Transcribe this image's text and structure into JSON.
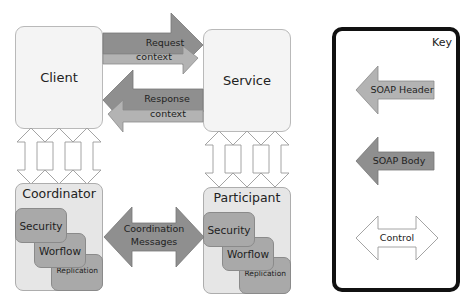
{
  "diagram": {
    "nodes": {
      "client": {
        "label": "Client"
      },
      "service": {
        "label": "Service"
      },
      "coordinator": {
        "label": "Coordinator",
        "modules": [
          {
            "label": "Security"
          },
          {
            "label": "Worflow"
          },
          {
            "label": "Replication"
          }
        ]
      },
      "participant": {
        "label": "Participant",
        "modules": [
          {
            "label": "Security"
          },
          {
            "label": "Worflow"
          },
          {
            "label": "Replication"
          }
        ]
      }
    },
    "edges": {
      "request": {
        "line1": "Request",
        "line2": "context",
        "from": "Client",
        "to": "Service"
      },
      "response": {
        "line1": "Response",
        "line2": "context",
        "from": "Service",
        "to": "Client"
      },
      "coordination": {
        "line1": "Coordination",
        "line2": "Messages",
        "between": [
          "Coordinator",
          "Participant"
        ]
      },
      "client_coordinator_controls": 3,
      "service_participant_controls": 3
    },
    "colors": {
      "soap_header": "#b3b3b3",
      "soap_body": "#8f8f8f",
      "control_fill": "#ffffff",
      "node_fill": "#f4f4f4",
      "container_fill": "#e6e6e6",
      "module_fill": "#a9a9a9",
      "key_border": "#111111"
    }
  },
  "key": {
    "title": "Key",
    "items": [
      {
        "label": "SOAP Header",
        "style": "light-gray-left-arrow"
      },
      {
        "label": "SOAP Body",
        "style": "dark-gray-left-arrow"
      },
      {
        "label": "Control",
        "style": "white-double-arrow"
      }
    ]
  }
}
